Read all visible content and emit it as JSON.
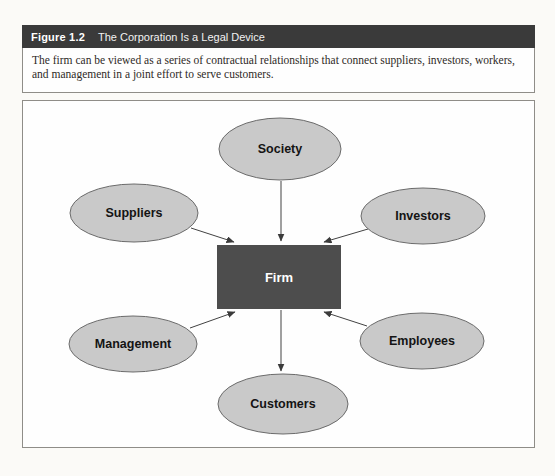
{
  "figure": {
    "label": "Figure 1.2",
    "title": "The Corporation Is a Legal Device",
    "caption": "The firm can be viewed as a series of contractual relationships that connect suppliers, investors, workers, and management in a joint effort to serve customers."
  },
  "diagram": {
    "center_node": {
      "label": "Firm",
      "shape": "rectangle"
    },
    "nodes": [
      {
        "id": "society",
        "label": "Society",
        "position": "top-center",
        "shape": "ellipse"
      },
      {
        "id": "suppliers",
        "label": "Suppliers",
        "position": "middle-left",
        "shape": "ellipse"
      },
      {
        "id": "investors",
        "label": "Investors",
        "position": "middle-right",
        "shape": "ellipse"
      },
      {
        "id": "management",
        "label": "Management",
        "position": "lower-left",
        "shape": "ellipse"
      },
      {
        "id": "employees",
        "label": "Employees",
        "position": "lower-right",
        "shape": "ellipse"
      },
      {
        "id": "customers",
        "label": "Customers",
        "position": "bottom-center",
        "shape": "ellipse"
      }
    ],
    "edges": [
      {
        "from": "Society",
        "to": "Firm"
      },
      {
        "from": "Suppliers",
        "to": "Firm"
      },
      {
        "from": "Investors",
        "to": "Firm"
      },
      {
        "from": "Management",
        "to": "Firm"
      },
      {
        "from": "Employees",
        "to": "Firm"
      },
      {
        "from": "Firm",
        "to": "Customers"
      }
    ],
    "style": {
      "header_bar_color": "#3a3a3a",
      "node_fill": "#c9c9c9",
      "node_stroke": "#6b6b6b",
      "firm_fill": "#4d4d4d",
      "firm_text_color": "#ffffff",
      "arrow_color": "#424242"
    }
  }
}
